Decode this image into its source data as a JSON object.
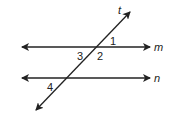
{
  "diagram": {
    "lines": [
      {
        "name": "m",
        "label": "m",
        "type": "parallel-line"
      },
      {
        "name": "n",
        "label": "n",
        "type": "parallel-line"
      },
      {
        "name": "t",
        "label": "t",
        "type": "transversal"
      }
    ],
    "angles": [
      {
        "label": "1"
      },
      {
        "label": "2"
      },
      {
        "label": "3"
      },
      {
        "label": "4"
      }
    ],
    "colors": {
      "stroke": "#222222",
      "background": "#ffffff"
    }
  }
}
